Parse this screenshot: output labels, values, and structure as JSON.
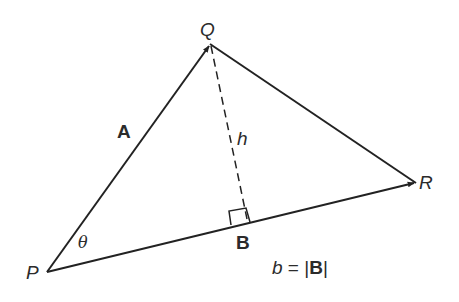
{
  "diagram": {
    "points": {
      "P": {
        "label": "P",
        "x": 47,
        "y": 272
      },
      "Q": {
        "label": "Q",
        "x": 210,
        "y": 44
      },
      "R": {
        "label": "R",
        "x": 416,
        "y": 183
      },
      "foot": {
        "x": 248,
        "y": 221
      }
    },
    "labels": {
      "P": "P",
      "Q": "Q",
      "R": "R",
      "vector_A": "A",
      "vector_B": "B",
      "height": "h",
      "angle": "θ",
      "equation_lhs": "b",
      "equation_eq": " = ",
      "equation_rhs_open": "|",
      "equation_rhs_vec": "B",
      "equation_rhs_close": "|"
    },
    "edges": [
      {
        "from": "P",
        "to": "Q",
        "style": "solid",
        "arrow": true,
        "name": "vector-A"
      },
      {
        "from": "P",
        "to": "R",
        "style": "solid",
        "arrow": true,
        "name": "vector-B"
      },
      {
        "from": "Q",
        "to": "R",
        "style": "solid",
        "arrow": false,
        "name": "side-QR"
      },
      {
        "from": "Q",
        "to": "foot",
        "style": "dashed",
        "arrow": false,
        "name": "height-h"
      }
    ],
    "colors": {
      "stroke": "#222222",
      "text": "#2b2b2b",
      "background": "#ffffff"
    }
  }
}
